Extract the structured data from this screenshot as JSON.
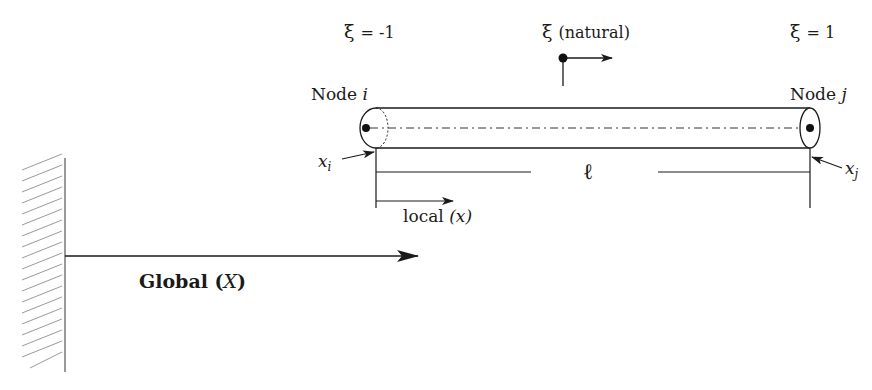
{
  "diagram": {
    "title": "",
    "colors": {
      "ink": "#1a1a1a",
      "hatch": "#888888",
      "background": "#ffffff"
    },
    "labels": {
      "xi_left": {
        "symbol": "ξ",
        "value": "= -1"
      },
      "xi_center": {
        "symbol": "ξ",
        "text": "(natural)"
      },
      "xi_right": {
        "symbol": "ξ",
        "value": "= 1"
      },
      "node_i": {
        "text": "Node",
        "var": "i"
      },
      "node_j": {
        "text": "Node",
        "var": "j"
      },
      "x_i": {
        "var": "x",
        "sub": "i"
      },
      "x_j": {
        "var": "x",
        "sub": "j"
      },
      "length": "ℓ",
      "local": {
        "text": "local",
        "var": "(x)"
      },
      "global": {
        "text": "Global",
        "open": "(",
        "var": "X",
        "close": ")"
      }
    },
    "elements": {
      "wall": {
        "type": "fixed-support",
        "x": 65,
        "y_top": 158,
        "y_bottom": 372
      },
      "global_axis": {
        "from": [
          65,
          256
        ],
        "to": [
          418,
          256
        ]
      },
      "beam": {
        "x_start": 376,
        "x_end": 810,
        "y_top": 108,
        "y_bottom": 148
      },
      "dimension_length": {
        "y": 172,
        "x_start": 376,
        "x_end": 810
      },
      "local_axis": {
        "from": [
          376,
          206
        ],
        "to": [
          453,
          206
        ]
      },
      "natural_axis": {
        "origin": [
          563,
          58
        ],
        "to": [
          612,
          58
        ]
      }
    }
  }
}
